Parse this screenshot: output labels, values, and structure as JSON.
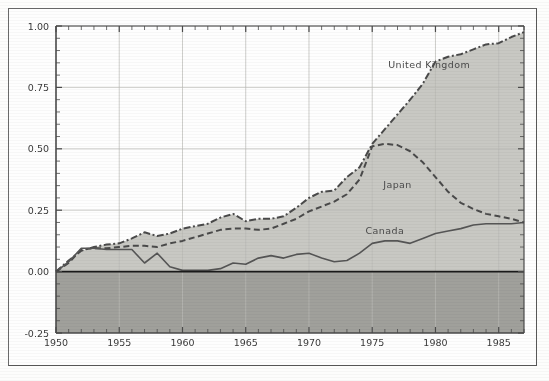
{
  "chart_data": {
    "type": "area",
    "title": "",
    "xlabel": "",
    "ylabel": "",
    "xlim": [
      1950,
      1987
    ],
    "ylim": [
      -0.25,
      1.0
    ],
    "grid": true,
    "legend_position": "inline-annotations",
    "y_ticks": [
      "1.00",
      "0.75",
      "0.50",
      "0.25",
      "0.00",
      "-0.25"
    ],
    "y_tick_values": [
      1.0,
      0.75,
      0.5,
      0.25,
      0.0,
      -0.25
    ],
    "x_ticks": [
      "1950",
      "1955",
      "1960",
      "1965",
      "1970",
      "1975",
      "1980",
      "1985"
    ],
    "x_tick_values": [
      1950,
      1955,
      1960,
      1965,
      1970,
      1975,
      1980,
      1985
    ],
    "x": [
      1950,
      1951,
      1952,
      1953,
      1954,
      1955,
      1956,
      1957,
      1958,
      1959,
      1960,
      1961,
      1962,
      1963,
      1964,
      1965,
      1966,
      1967,
      1968,
      1969,
      1970,
      1971,
      1972,
      1973,
      1974,
      1975,
      1976,
      1977,
      1978,
      1979,
      1980,
      1981,
      1982,
      1983,
      1984,
      1985,
      1986,
      1987
    ],
    "series": [
      {
        "name": "United Kingdom",
        "style": "dash-dot",
        "color": "#4a4a4a",
        "fill": "#c9c9c4",
        "label_x": 1979.5,
        "label_y": 0.83,
        "values": [
          0.0,
          0.045,
          0.085,
          0.1,
          0.11,
          0.115,
          0.135,
          0.16,
          0.145,
          0.155,
          0.175,
          0.185,
          0.195,
          0.22,
          0.235,
          0.205,
          0.215,
          0.215,
          0.225,
          0.26,
          0.3,
          0.325,
          0.33,
          0.385,
          0.425,
          0.52,
          0.58,
          0.64,
          0.7,
          0.765,
          0.855,
          0.875,
          0.885,
          0.905,
          0.925,
          0.93,
          0.955,
          0.975
        ]
      },
      {
        "name": "Japan",
        "style": "dashed",
        "color": "#4a4a4a",
        "fill": "#c4c4bf",
        "label_x": 1977.0,
        "label_y": 0.34,
        "values": [
          0.0,
          0.035,
          0.09,
          0.095,
          0.095,
          0.1,
          0.105,
          0.105,
          0.1,
          0.115,
          0.125,
          0.14,
          0.155,
          0.17,
          0.175,
          0.175,
          0.17,
          0.175,
          0.195,
          0.215,
          0.245,
          0.265,
          0.285,
          0.315,
          0.375,
          0.51,
          0.52,
          0.515,
          0.49,
          0.445,
          0.385,
          0.325,
          0.28,
          0.255,
          0.235,
          0.225,
          0.215,
          0.2
        ]
      },
      {
        "name": "Canada",
        "style": "solid",
        "color": "#555555",
        "fill": "#bdbdb8",
        "label_x": 1976.0,
        "label_y": 0.155,
        "values": [
          0.0,
          0.04,
          0.095,
          0.095,
          0.09,
          0.09,
          0.09,
          0.035,
          0.075,
          0.02,
          0.005,
          0.005,
          0.005,
          0.012,
          0.035,
          0.03,
          0.055,
          0.065,
          0.055,
          0.07,
          0.075,
          0.055,
          0.04,
          0.045,
          0.075,
          0.115,
          0.125,
          0.125,
          0.115,
          0.135,
          0.155,
          0.165,
          0.175,
          0.19,
          0.195,
          0.195,
          0.195,
          0.2
        ]
      }
    ],
    "colors": {
      "positive_band_fill": "#c8c8c3",
      "negative_band_fill": "#a0a09b",
      "trailing_band_fill": "#c4c4bf",
      "zero_line": "#1a1a1a",
      "axis": "#4a4a4a",
      "gridline": "#b9b9b4",
      "frame": "#585858",
      "background": "#fefefe"
    }
  }
}
